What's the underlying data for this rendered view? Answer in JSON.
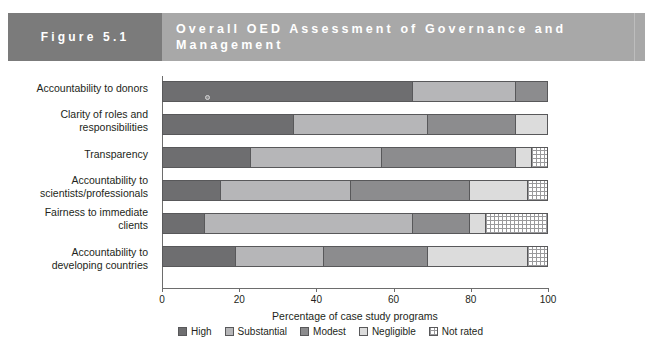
{
  "header": {
    "figure_label": "Figure 5.1",
    "title": "Overall OED Assessment of Governance and Management",
    "tab_color": "#7b7b7b",
    "title_bg_color": "#a8a8a8"
  },
  "chart_data": {
    "type": "bar",
    "orientation": "horizontal",
    "stacked": true,
    "percent": true,
    "title": "Overall OED Assessment of Governance and Management",
    "xlabel": "Percentage of case study programs",
    "ylabel": "",
    "xlim": [
      0,
      100
    ],
    "xticks": [
      0,
      20,
      40,
      60,
      80,
      100
    ],
    "xtick_labels": [
      "0",
      "20",
      "40",
      "60",
      "80",
      "100"
    ],
    "grid": false,
    "legend_position": "bottom",
    "categories": [
      "Accountability to donors",
      "Clarity of roles and\nresponsibilities",
      "Transparency",
      "Accountability to\nscientists/professionals",
      "Fairness to immediate\nclients",
      "Accountability to\ndeveloping countries"
    ],
    "series": [
      {
        "name": "High",
        "color": "#6e6e70",
        "values": [
          65,
          34,
          23,
          15,
          11,
          19
        ]
      },
      {
        "name": "Substantial",
        "color": "#b6b6b8",
        "values": [
          27,
          35,
          34,
          34,
          54,
          23
        ]
      },
      {
        "name": "Modest",
        "color": "#8c8c8e",
        "values": [
          8,
          23,
          35,
          31,
          15,
          27
        ]
      },
      {
        "name": "Negligible",
        "color": "#dcdcdc",
        "values": [
          0,
          8,
          4,
          15,
          4,
          26
        ]
      },
      {
        "name": "Not rated",
        "color": "#ffffff",
        "values": [
          0,
          0,
          4,
          5,
          16,
          5
        ]
      }
    ]
  },
  "legend": {
    "items": [
      {
        "label": "High",
        "swatch": "sw-high"
      },
      {
        "label": "Substantial",
        "swatch": "sw-substantial"
      },
      {
        "label": "Modest",
        "swatch": "sw-modest"
      },
      {
        "label": "Negligible",
        "swatch": "sw-negligible"
      },
      {
        "label": "Not rated",
        "swatch": "sw-notrated"
      }
    ]
  },
  "axis": {
    "title": "Percentage of case study programs"
  }
}
